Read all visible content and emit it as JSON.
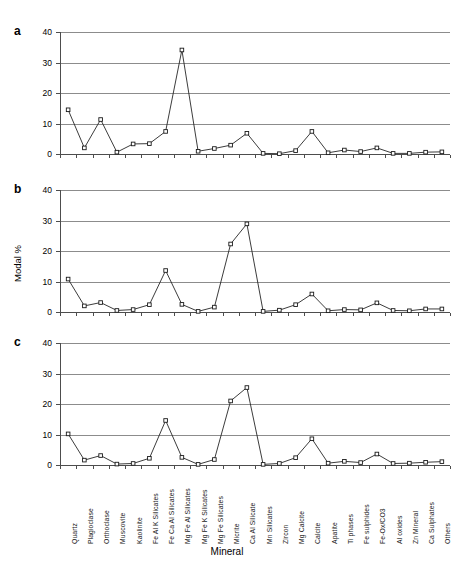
{
  "figure": {
    "ylabel": "Modal %",
    "xlabel": "Mineral",
    "panel_letters": [
      "a",
      "b",
      "c"
    ]
  },
  "chart_data": {
    "type": "line",
    "title": "",
    "xlabel": "Mineral",
    "ylabel": "Modal %",
    "ylim": [
      0,
      40
    ],
    "yticks": [
      0,
      10,
      20,
      30,
      40
    ],
    "grid": "horizontal",
    "legend": "none",
    "marker": "open-square",
    "categories": [
      "Quartz",
      "Plagioclase",
      "Orthoclase",
      "Muscovite",
      "Kaolinite",
      "Fe Al K Silicates",
      "Fe Ca Al Silicates",
      "Mg Fe Al Silicates",
      "Mg Fe K Silicates",
      "Mg Fe Silicates",
      "Micrite",
      "Ca Al Silicate",
      "Mn Silicates",
      "Zircon",
      "Mg Calcite",
      "Calcite",
      "Apatite",
      "Ti phases",
      "Fe sulphides",
      "Fe-Ox/CO3",
      "Al oxides",
      "Zn Mineral",
      "Ca Sulphates",
      "Others"
    ],
    "panels": [
      {
        "label": "a",
        "values": [
          14.5,
          2.0,
          11.3,
          0.6,
          3.3,
          3.4,
          7.4,
          34.1,
          0.9,
          1.8,
          2.9,
          6.8,
          0.2,
          0.1,
          1.1,
          7.4,
          0.4,
          1.3,
          0.8,
          2.0,
          0.2,
          0.2,
          0.6,
          0.7
        ]
      },
      {
        "label": "b",
        "values": [
          10.8,
          2.0,
          3.1,
          0.5,
          0.8,
          2.4,
          13.6,
          2.5,
          0.2,
          1.6,
          22.3,
          28.9,
          0.2,
          0.6,
          2.4,
          5.9,
          0.4,
          0.8,
          0.7,
          3.0,
          0.5,
          0.4,
          1.0,
          1.0
        ]
      },
      {
        "label": "c",
        "values": [
          10.2,
          1.6,
          3.1,
          0.3,
          0.5,
          2.2,
          14.6,
          2.5,
          0.2,
          1.8,
          21.0,
          25.4,
          0.2,
          0.5,
          2.4,
          8.6,
          0.6,
          1.2,
          0.8,
          3.6,
          0.5,
          0.6,
          0.9,
          1.1
        ]
      }
    ]
  }
}
